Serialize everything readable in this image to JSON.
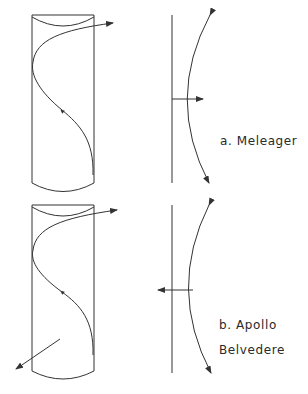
{
  "figure": {
    "panels": [
      {
        "id": "a",
        "label": "a. Meleager",
        "cylinder": "S-curve spiral on cylinder, exiting top right",
        "side_view": "vertical axis with curved arc, arrow pointing right (outward)"
      },
      {
        "id": "b",
        "label_line1": "b. Apollo",
        "label_line2": "Belvedere",
        "cylinder": "S-curve spiral on cylinder, exiting top right, with arrow pointing out lower left",
        "side_view": "vertical axis with curved arc, arrow pointing left (inward)"
      }
    ],
    "colors": {
      "stroke": "#333333",
      "background": "#ffffff"
    }
  }
}
